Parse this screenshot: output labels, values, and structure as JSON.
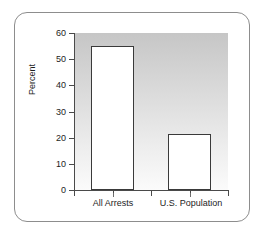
{
  "chart_data": {
    "type": "bar",
    "title": "",
    "xlabel": "",
    "ylabel": "Percent",
    "categories": [
      "All Arrests",
      "U.S. Population"
    ],
    "values": [
      55,
      21.5
    ],
    "ylim": [
      0,
      60
    ],
    "yticks": [
      0,
      10,
      20,
      30,
      40,
      50,
      60
    ],
    "ytick_labels": [
      "0",
      "10",
      "20",
      "30",
      "40",
      "50",
      "60"
    ],
    "grid": false,
    "legend": null,
    "series": [
      {
        "name": "Percent",
        "values": [
          55,
          21.5
        ]
      }
    ],
    "annotations": []
  },
  "axis": {
    "y_title": "Percent",
    "ticks": [
      {
        "label": "60",
        "value": 60
      },
      {
        "label": "50",
        "value": 50
      },
      {
        "label": "40",
        "value": 40
      },
      {
        "label": "30",
        "value": 30
      },
      {
        "label": "20",
        "value": 20
      },
      {
        "label": "10",
        "value": 10
      },
      {
        "label": "0",
        "value": 0
      }
    ]
  },
  "bars": [
    {
      "label": "All Arrests",
      "value": 55
    },
    {
      "label": "U.S. Population",
      "value": 21.5
    }
  ],
  "colors": {
    "bar_fill": "#ffffff",
    "bar_stroke": "#3a3a3a",
    "axis": "#4a4a4a",
    "frame": "#8d8d8d",
    "text": "#1d1d1d",
    "panel_top": "#c6c6c6",
    "panel_bottom": "#fbfbfb"
  }
}
